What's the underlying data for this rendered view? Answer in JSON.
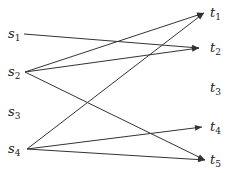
{
  "diagram": {
    "type": "bipartite-directed-graph",
    "sources": [
      {
        "id": "s1",
        "name": "s",
        "sub": "1",
        "x": 8,
        "y": 38,
        "ax": 24,
        "ay": 34
      },
      {
        "id": "s2",
        "name": "s",
        "sub": "2",
        "x": 8,
        "y": 76,
        "ax": 25,
        "ay": 72
      },
      {
        "id": "s3",
        "name": "s",
        "sub": "3",
        "x": 8,
        "y": 116,
        "ax": 25,
        "ay": 112
      },
      {
        "id": "s4",
        "name": "s",
        "sub": "4",
        "x": 8,
        "y": 153,
        "ax": 27,
        "ay": 149
      }
    ],
    "targets": [
      {
        "id": "t1",
        "name": "t",
        "sub": "1",
        "x": 210,
        "y": 17,
        "ax": 204,
        "ay": 13
      },
      {
        "id": "t2",
        "name": "t",
        "sub": "2",
        "x": 210,
        "y": 52,
        "ax": 199,
        "ay": 48
      },
      {
        "id": "t3",
        "name": "t",
        "sub": "3",
        "x": 210,
        "y": 92,
        "ax": 204,
        "ay": 88
      },
      {
        "id": "t4",
        "name": "t",
        "sub": "4",
        "x": 210,
        "y": 131,
        "ax": 202,
        "ay": 127
      },
      {
        "id": "t5",
        "name": "t",
        "sub": "5",
        "x": 210,
        "y": 164,
        "ax": 205,
        "ay": 160
      }
    ],
    "edges": [
      {
        "from": "s1",
        "to": "t2"
      },
      {
        "from": "s2",
        "to": "t1"
      },
      {
        "from": "s2",
        "to": "t2"
      },
      {
        "from": "s2",
        "to": "t5"
      },
      {
        "from": "s4",
        "to": "t1"
      },
      {
        "from": "s4",
        "to": "t4"
      },
      {
        "from": "s4",
        "to": "t5"
      }
    ],
    "colors": {
      "line": "#333333",
      "text": "#222222"
    }
  }
}
